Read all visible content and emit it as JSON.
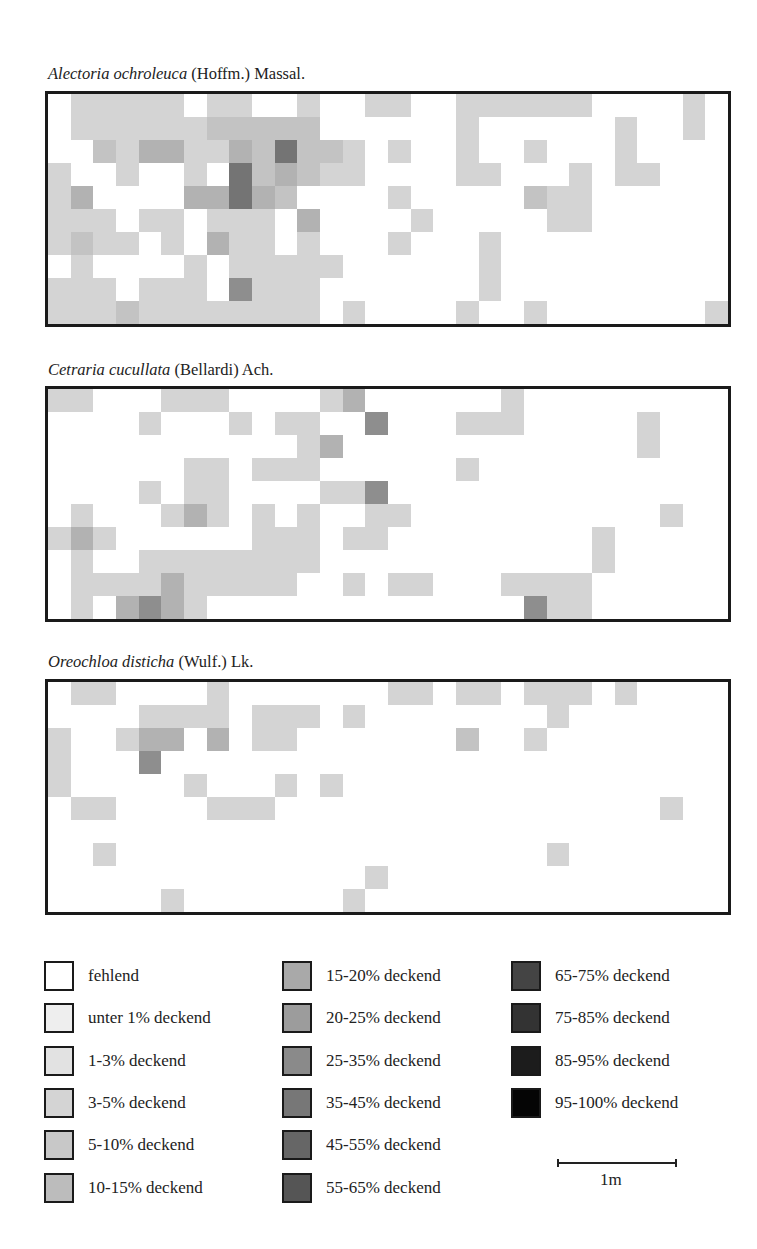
{
  "chart_data": {
    "type": "heatmap",
    "title": "",
    "grid": {
      "columns": 30,
      "rows": 10
    },
    "level_key": {
      "0": "fehlend",
      "1": "1-3% deckend",
      "2": "3-5% deckend",
      "3": "5-10% deckend",
      "4": "15-20% deckend",
      "5": "25-35% deckend",
      "6": "45-55% deckend"
    },
    "panels": [
      {
        "species": "Alectoria ochroleuca",
        "authority": "(Hoffm.) Massal.",
        "rows": [
          "022222022002002200222222000020",
          "022222233333000000200000020020",
          "003244224363320200200200020000",
          "200200206343220000220002022000",
          "240000446430000200000322000000",
          "222022022204000020000022000000",
          "232202042202000200020000000000",
          "020000202222200000020000000000",
          "222022205222000000020000000000",
          "222322222222020000200200000002"
        ]
      },
      {
        "species": "Cetraria cucullata",
        "authority": "(Bellardi) Ach.",
        "rows": [
          "220002220000240000002000000000",
          "000020002022005000222000002000",
          "000000000002400000000000002000",
          "000000220222000000200000000000",
          "000020220000225000000000000000",
          "020002420202002200000000000200",
          "242000000222022000000000200000",
          "020022222222000000000000200000",
          "022224222220020220002222000000",
          "020454200000000000000522000000"
        ]
      },
      {
        "species": "Oreochloa disticha",
        "authority": "(Wulf.) Lk.",
        "rows": [
          "022000020000000220220222020000",
          "000022220222020000000020000000",
          "200244040220000000300200000000",
          "200050000000000000000000000000",
          "200000200020200000000000000000",
          "022000022200000000000000000200",
          "000000000000000000000000000000",
          "002000000000000000000020000000",
          "000000000000002000000000000000",
          "000002000000020000000000000000"
        ]
      }
    ],
    "legend": [
      "fehlend",
      "unter 1% deckend",
      "1-3% deckend",
      "3-5% deckend",
      "5-10% deckend",
      "10-15% deckend",
      "15-20% deckend",
      "20-25% deckend",
      "25-35% deckend",
      "35-45% deckend",
      "45-55% deckend",
      "55-65% deckend",
      "65-75% deckend",
      "75-85% deckend",
      "85-95% deckend",
      "95-100% deckend"
    ],
    "scale": "1m"
  },
  "panels": [
    {
      "species": "Alectoria ochroleuca",
      "authority": " (Hoffm.) Massal."
    },
    {
      "species": "Cetraria cucullata",
      "authority": " (Bellardi) Ach."
    },
    {
      "species": "Oreochloa disticha",
      "authority": " (Wulf.) Lk."
    }
  ],
  "legend": {
    "items": [
      {
        "label": "fehlend",
        "color": "#ffffff"
      },
      {
        "label": "unter 1% deckend",
        "color": "#eeeeee"
      },
      {
        "label": "1-3% deckend",
        "color": "#e2e2e2"
      },
      {
        "label": "3-5% deckend",
        "color": "#d4d4d4"
      },
      {
        "label": "5-10% deckend",
        "color": "#c8c8c8"
      },
      {
        "label": "10-15% deckend",
        "color": "#bcbcbc"
      },
      {
        "label": "15-20% deckend",
        "color": "#a9a9a9"
      },
      {
        "label": "20-25% deckend",
        "color": "#9c9c9c"
      },
      {
        "label": "25-35% deckend",
        "color": "#8a8a8a"
      },
      {
        "label": "35-45% deckend",
        "color": "#777777"
      },
      {
        "label": "45-55% deckend",
        "color": "#666666"
      },
      {
        "label": "55-65% deckend",
        "color": "#555555"
      },
      {
        "label": "65-75% deckend",
        "color": "#444444"
      },
      {
        "label": "75-85% deckend",
        "color": "#333333"
      },
      {
        "label": "85-95% deckend",
        "color": "#1c1c1c"
      },
      {
        "label": "95-100% deckend",
        "color": "#050505"
      }
    ]
  },
  "scale": {
    "label": "1m"
  }
}
